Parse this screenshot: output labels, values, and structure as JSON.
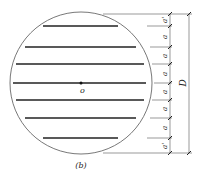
{
  "diagram": {
    "caption": "(b)",
    "center_label": "o",
    "dimension_total_label": "D",
    "segment_labels": [
      "a'",
      "a",
      "a",
      "a",
      "a",
      "a",
      "a",
      "a'"
    ],
    "chord_count": 7,
    "colors": {
      "stroke": "#333333",
      "chord": "#222222",
      "background": "#ffffff"
    }
  }
}
